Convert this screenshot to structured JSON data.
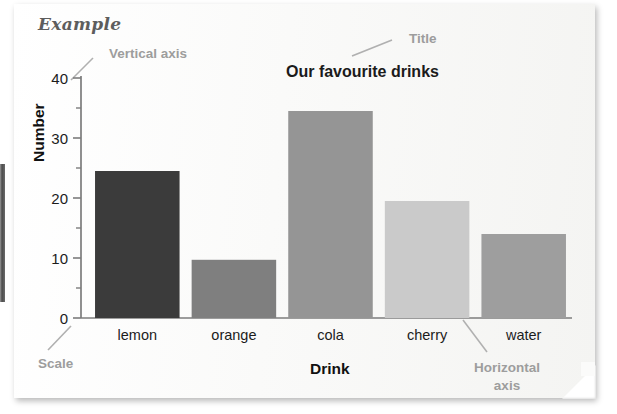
{
  "page": {
    "heading": "Example"
  },
  "annotations": {
    "vertical_axis": "Vertical axis",
    "title": "Title",
    "scale": "Scale",
    "horizontal_axis_line1": "Horizontal",
    "horizontal_axis_line2": "axis"
  },
  "colors": {
    "annotation": "#9d9d9d",
    "axis": "#7c7c7c",
    "text": "#1c1c1c",
    "page": "#fbfbfa"
  },
  "chart_data": {
    "type": "bar",
    "title": "Our favourite drinks",
    "xlabel": "Drink",
    "ylabel": "Number",
    "categories": [
      "lemon",
      "orange",
      "cola",
      "cherry",
      "water"
    ],
    "values": [
      24.5,
      9.7,
      34.5,
      19.5,
      14
    ],
    "bar_colors": [
      "#3b3b3b",
      "#7f7f7f",
      "#959595",
      "#cacaca",
      "#9e9e9e"
    ],
    "ylim": [
      0,
      42
    ],
    "yticks": [
      0,
      10,
      20,
      30,
      40
    ],
    "ytick_labels": [
      "0",
      "10",
      "20",
      "30",
      "40"
    ],
    "minor_tick_step": 5,
    "grid": false,
    "legend": "none"
  }
}
